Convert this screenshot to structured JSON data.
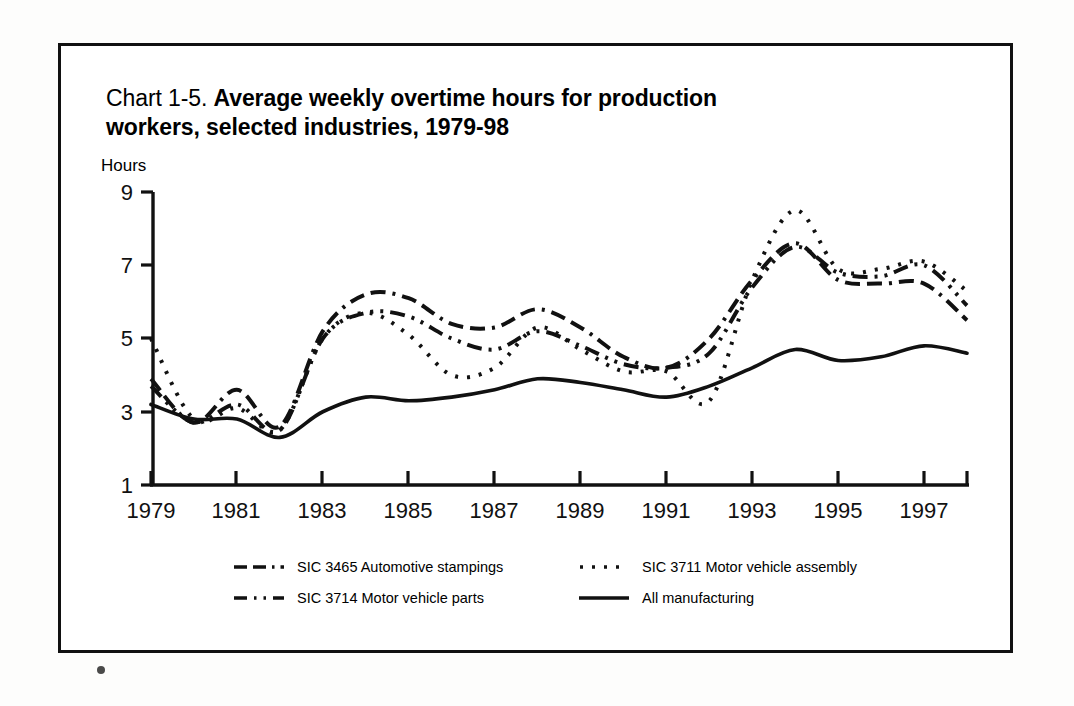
{
  "page": {
    "background_color": "#fdfdfc",
    "frame_color": "#111111",
    "artifact_name": "page-scan-dot"
  },
  "title": {
    "lead": "Chart 1-5. ",
    "strong": "Average weekly overtime hours for production workers, selected industries, 1979-98",
    "full": "Chart 1-5. Average weekly overtime hours for production workers, selected industries, 1979-98"
  },
  "axis": {
    "y_label": "Hours",
    "y_ticks": [
      "9",
      "7",
      "5",
      "3",
      "1"
    ],
    "x_ticks": [
      "1979",
      "1981",
      "1983",
      "1985",
      "1987",
      "1989",
      "1991",
      "1993",
      "1995",
      "1997"
    ]
  },
  "legend": {
    "rows": [
      [
        {
          "style": "dash-dash-dot",
          "label": "SIC 3465 Automotive stampings"
        },
        {
          "style": "dotted",
          "label": "SIC 3711 Motor vehicle assembly"
        }
      ],
      [
        {
          "style": "dash-dot-dot",
          "label": "SIC 3714 Motor vehicle parts"
        },
        {
          "style": "solid",
          "label": "All manufacturing"
        }
      ]
    ]
  },
  "chart_data": {
    "type": "line",
    "title": "Chart 1-5. Average weekly overtime hours for production workers, selected industries, 1979-98",
    "xlabel": "",
    "ylabel": "Hours",
    "ylim": [
      1,
      9
    ],
    "xlim": [
      1979,
      1998
    ],
    "grid": false,
    "legend_position": "bottom",
    "y_ticks": [
      1,
      3,
      5,
      7,
      9
    ],
    "x_tick_labels": [
      1979,
      1981,
      1983,
      1985,
      1987,
      1989,
      1991,
      1993,
      1995,
      1997
    ],
    "x": [
      1979,
      1980,
      1981,
      1982,
      1983,
      1984,
      1985,
      1986,
      1987,
      1988,
      1989,
      1990,
      1991,
      1992,
      1993,
      1994,
      1995,
      1996,
      1997,
      1998
    ],
    "series": [
      {
        "name": "SIC 3465 Automotive stampings",
        "style": "dash-dash-dot",
        "values": [
          3.9,
          2.7,
          3.6,
          2.6,
          5.2,
          6.2,
          6.1,
          5.4,
          5.3,
          5.8,
          5.3,
          4.5,
          4.2,
          5.0,
          6.6,
          7.6,
          6.6,
          6.5,
          6.5,
          5.5
        ]
      },
      {
        "name": "SIC 3711 Motor vehicle assembly",
        "style": "dotted",
        "values": [
          5.0,
          2.8,
          3.1,
          2.5,
          5.0,
          5.7,
          5.1,
          4.0,
          4.2,
          5.3,
          4.7,
          4.1,
          4.1,
          3.3,
          6.6,
          8.5,
          6.9,
          6.9,
          7.1,
          6.3
        ]
      },
      {
        "name": "SIC 3714 Motor vehicle parts",
        "style": "dash-dot-dot",
        "values": [
          3.7,
          2.7,
          3.2,
          2.5,
          5.0,
          5.7,
          5.6,
          5.0,
          4.7,
          5.2,
          4.8,
          4.3,
          4.2,
          4.6,
          6.4,
          7.5,
          6.8,
          6.7,
          7.0,
          5.9
        ]
      },
      {
        "name": "All manufacturing",
        "style": "solid",
        "values": [
          3.2,
          2.8,
          2.8,
          2.3,
          3.0,
          3.4,
          3.3,
          3.4,
          3.6,
          3.9,
          3.8,
          3.6,
          3.4,
          3.7,
          4.2,
          4.7,
          4.4,
          4.5,
          4.8,
          4.6
        ]
      }
    ]
  }
}
